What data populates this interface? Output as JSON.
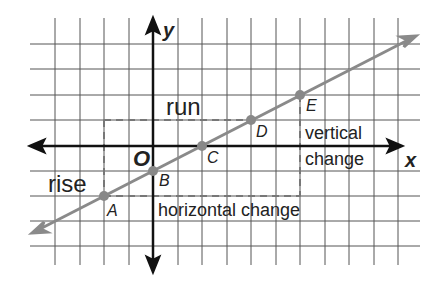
{
  "diagram": {
    "type": "coordinate-plane-slope",
    "axes": {
      "x_label": "x",
      "y_label": "y",
      "origin_label": "O"
    },
    "grid": {
      "x_min": -5,
      "x_max": 10,
      "y_min": -4,
      "y_max": 4,
      "step": 1
    },
    "points": [
      {
        "label": "A",
        "x": -2,
        "y": -2
      },
      {
        "label": "B",
        "x": 0,
        "y": -1
      },
      {
        "label": "C",
        "x": 2,
        "y": 0
      },
      {
        "label": "D",
        "x": 4,
        "y": 1
      },
      {
        "label": "E",
        "x": 6,
        "y": 2
      }
    ],
    "line": {
      "slope": 0.5,
      "y_intercept": -1,
      "color": "#8a8a8a"
    },
    "labels": {
      "run": "run",
      "rise": "rise",
      "vertical_change_1": "vertical",
      "vertical_change_2": "change",
      "horizontal_change": "horizontal change"
    }
  }
}
